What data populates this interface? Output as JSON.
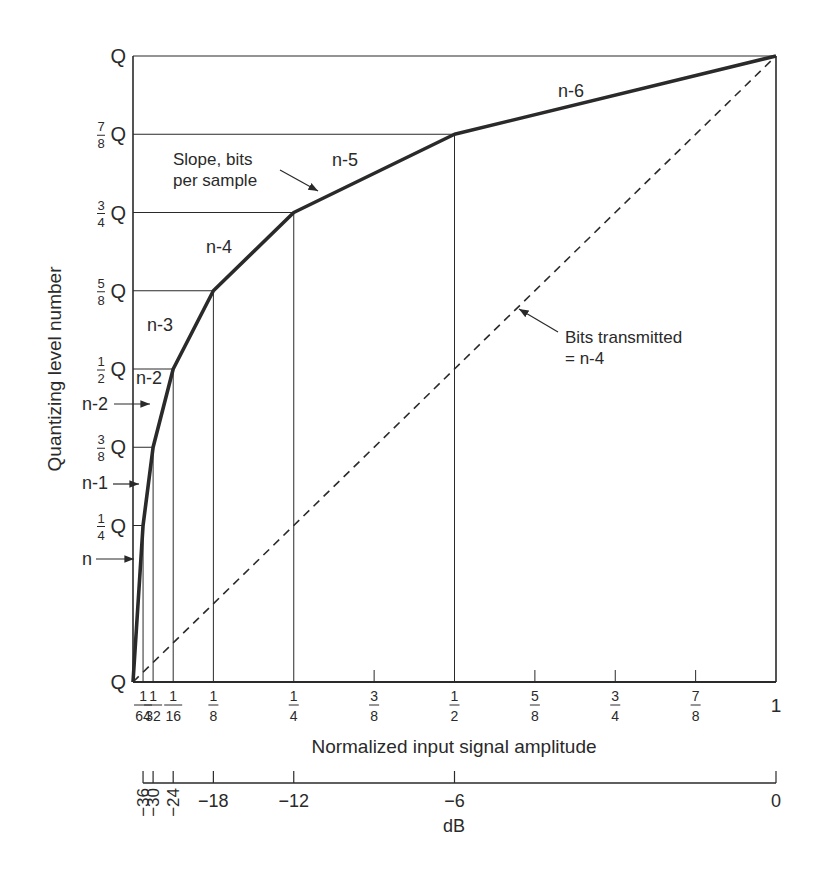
{
  "chart_data": {
    "type": "line",
    "title": "",
    "xlabel": "Normalized input signal amplitude",
    "ylabel": "Quantizing level number",
    "x2label": "dB",
    "xlim": [
      0,
      1
    ],
    "ylim": [
      0,
      1
    ],
    "grid": false,
    "x_ticks": [
      {
        "value": 0.015625,
        "num": "1",
        "den": "64",
        "major": true
      },
      {
        "value": 0.03125,
        "num": "1",
        "den": "32",
        "major": true
      },
      {
        "value": 0.0625,
        "num": "1",
        "den": "16",
        "major": true
      },
      {
        "value": 0.125,
        "num": "1",
        "den": "8",
        "major": true
      },
      {
        "value": 0.25,
        "num": "1",
        "den": "4",
        "major": true
      },
      {
        "value": 0.375,
        "num": "3",
        "den": "8",
        "major": false
      },
      {
        "value": 0.5,
        "num": "1",
        "den": "2",
        "major": true
      },
      {
        "value": 0.625,
        "num": "5",
        "den": "8",
        "major": false
      },
      {
        "value": 0.75,
        "num": "3",
        "den": "4",
        "major": false
      },
      {
        "value": 0.875,
        "num": "7",
        "den": "8",
        "major": false
      },
      {
        "value": 1.0,
        "num": "1",
        "den": "",
        "major": true
      }
    ],
    "y_ticks": [
      {
        "value": 0,
        "num": "",
        "den": "",
        "label": "Q"
      },
      {
        "value": 0.25,
        "num": "1",
        "den": "4",
        "label": "Q"
      },
      {
        "value": 0.375,
        "num": "3",
        "den": "8",
        "label": "Q"
      },
      {
        "value": 0.5,
        "num": "1",
        "den": "2",
        "label": "Q"
      },
      {
        "value": 0.625,
        "num": "5",
        "den": "8",
        "label": "Q"
      },
      {
        "value": 0.75,
        "num": "3",
        "den": "4",
        "label": "Q"
      },
      {
        "value": 0.875,
        "num": "7",
        "den": "8",
        "label": "Q"
      },
      {
        "value": 1.0,
        "num": "",
        "den": "",
        "label": "Q"
      }
    ],
    "db_ticks": [
      {
        "value": 0.015625,
        "label": "−36",
        "rotated": true
      },
      {
        "value": 0.03125,
        "label": "−30",
        "rotated": true
      },
      {
        "value": 0.0625,
        "label": "−24",
        "rotated": true
      },
      {
        "value": 0.125,
        "label": "−18",
        "rotated": false
      },
      {
        "value": 0.25,
        "label": "−12",
        "rotated": false
      },
      {
        "value": 0.5,
        "label": "−6",
        "rotated": false
      },
      {
        "value": 1.0,
        "label": "0",
        "rotated": false
      }
    ],
    "series": [
      {
        "name": "Companding characteristic (segmented)",
        "style": "solid-thick",
        "x": [
          0,
          0.015625,
          0.03125,
          0.0625,
          0.125,
          0.25,
          0.5,
          1.0
        ],
        "y": [
          0,
          0.25,
          0.375,
          0.5,
          0.625,
          0.75,
          0.875,
          1.0
        ],
        "segment_labels": [
          "n",
          "n-1",
          "n-2",
          "n-3",
          "n-4",
          "n-5",
          "n-6"
        ]
      },
      {
        "name": "Linear (Bits transmitted = n-4)",
        "style": "dashed",
        "x": [
          0,
          1.0
        ],
        "y": [
          0,
          1.0
        ]
      }
    ],
    "annotations": [
      {
        "text": "n-6",
        "x": 0.66,
        "y": 0.925
      },
      {
        "text": "n-5",
        "x": 0.355,
        "y": 0.84
      },
      {
        "text": "n-4",
        "x": 0.15,
        "y": 0.685
      },
      {
        "text": "n-3",
        "x": 0.045,
        "y": 0.565
      },
      {
        "text": "n-2",
        "x": 0.0,
        "y": 0.48,
        "boxed": true
      },
      {
        "text": "n-2",
        "arrow_to": [
          0.03,
          0.445
        ],
        "side": "left"
      },
      {
        "text": "n-1",
        "arrow_to": [
          0.012,
          0.31
        ],
        "side": "left"
      },
      {
        "text": "n",
        "arrow_to": [
          0.005,
          0.2
        ],
        "side": "left"
      },
      {
        "text_lines": [
          "Slope, bits",
          "per sample"
        ],
        "arrow_to": [
          0.29,
          0.775
        ]
      },
      {
        "text_lines": [
          "Bits transmitted",
          "= n-4"
        ],
        "arrow_to": [
          0.6,
          0.6
        ]
      }
    ]
  }
}
